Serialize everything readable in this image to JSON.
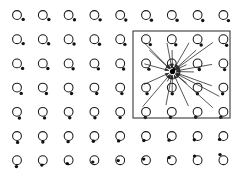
{
  "figure": {
    "width": 248,
    "height": 186,
    "background_color": "#ffffff"
  },
  "chart_data": {
    "type": "scatter",
    "subtitle": "",
    "xlabel": "",
    "ylabel": "",
    "xlim": [
      0,
      248
    ],
    "ylim": [
      0,
      186
    ],
    "grid": false,
    "legend_position": "none",
    "lattice": {
      "columns": 9,
      "rows": 7,
      "origin_x": 17,
      "origin_y": 15,
      "column_spacing": 25.8,
      "row_spacing": 24.2,
      "circle_radius": 4.4,
      "dot_radius": 1.7,
      "circle_color": "#ffffff",
      "circle_stroke": "#1a1a1a",
      "dot_color": "#111111",
      "dot_offsets_by_row": [
        [
          6.2,
          4.4
        ],
        [
          6.2,
          4.4
        ],
        [
          5.6,
          5.0
        ],
        [
          4.2,
          5.8
        ],
        [
          2.4,
          6.2
        ],
        [
          0.6,
          6.4
        ],
        [
          -0.6,
          6.4
        ]
      ],
      "dot_offset_right_columns_by_row": [
        [
          5.0,
          5.6
        ],
        [
          3.2,
          6.0
        ],
        [
          1.2,
          6.2
        ],
        [
          -0.8,
          6.2
        ],
        [
          -2.6,
          5.4
        ],
        [
          -3.8,
          3.4
        ],
        [
          -3.4,
          -5.6
        ]
      ]
    },
    "region_box": {
      "label": "summation region",
      "x": 133,
      "y": 31,
      "width": 97,
      "height": 87,
      "stroke": "#3a3a3a"
    },
    "center_ion": {
      "label": "reference ion",
      "x": 172.5,
      "y": 71.5,
      "radius": 2.6,
      "color": "#000000"
    },
    "vectors": {
      "count": 22,
      "stroke": "#2b2b2b",
      "arrow_direction": "inward",
      "targets": [
        {
          "x": 140.0,
          "y": 38.5,
          "kind": "circle"
        },
        {
          "x": 166.0,
          "y": 38.0,
          "kind": "circle"
        },
        {
          "x": 191.5,
          "y": 38.5,
          "kind": "circle"
        },
        {
          "x": 217.0,
          "y": 39.5,
          "kind": "circle"
        },
        {
          "x": 139.5,
          "y": 62.5,
          "kind": "circle"
        },
        {
          "x": 165.5,
          "y": 62.0,
          "kind": "circle"
        },
        {
          "x": 191.0,
          "y": 62.5,
          "kind": "circle"
        },
        {
          "x": 217.0,
          "y": 63.5,
          "kind": "circle"
        },
        {
          "x": 139.5,
          "y": 86.5,
          "kind": "circle"
        },
        {
          "x": 165.0,
          "y": 86.0,
          "kind": "circle"
        },
        {
          "x": 190.5,
          "y": 86.5,
          "kind": "circle"
        },
        {
          "x": 216.5,
          "y": 87.5,
          "kind": "circle"
        },
        {
          "x": 139.5,
          "y": 110.5,
          "kind": "circle"
        },
        {
          "x": 165.0,
          "y": 110.0,
          "kind": "circle"
        },
        {
          "x": 190.5,
          "y": 110.5,
          "kind": "circle"
        },
        {
          "x": 216.5,
          "y": 111.0,
          "kind": "circle"
        },
        {
          "x": 147.5,
          "y": 48.5,
          "kind": "dot"
        },
        {
          "x": 172.0,
          "y": 47.5,
          "kind": "dot"
        },
        {
          "x": 198.0,
          "y": 48.5,
          "kind": "dot"
        },
        {
          "x": 196.5,
          "y": 72.0,
          "kind": "dot"
        },
        {
          "x": 172.0,
          "y": 96.0,
          "kind": "dot"
        },
        {
          "x": 221.5,
          "y": 97.5,
          "kind": "dot"
        }
      ]
    }
  }
}
